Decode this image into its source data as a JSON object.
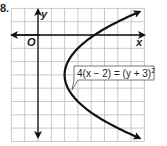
{
  "problem": {
    "number": "8."
  },
  "chart_data": {
    "type": "line",
    "title": "",
    "xlabel": "x",
    "ylabel": "y",
    "origin_label": "O",
    "grid": true,
    "xlim": [
      -2,
      8
    ],
    "ylim": [
      -8,
      2
    ],
    "series": [
      {
        "name": "4(x − 2) = (y + 3)^2",
        "equation": "4(x − 2) = (y + 3)²",
        "vertex": [
          2,
          -3
        ],
        "points": [
          [
            8.25,
            2
          ],
          [
            6,
            1
          ],
          [
            4.25,
            0
          ],
          [
            3,
            -1
          ],
          [
            2.25,
            -2
          ],
          [
            2,
            -3
          ],
          [
            2.25,
            -4
          ],
          [
            3,
            -5
          ],
          [
            4.25,
            -6
          ],
          [
            6,
            -7
          ],
          [
            8.25,
            -8
          ]
        ]
      }
    ],
    "annotation": {
      "text": "4(x − 2) = (y + 3)",
      "exponent": "2"
    }
  }
}
